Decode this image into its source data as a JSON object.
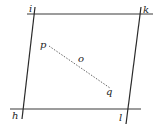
{
  "diagram": {
    "type": "geometric-figure",
    "background": "#ffffff",
    "stroke_color": "#2a2a2a",
    "lines": [
      {
        "name": "top-line",
        "from": [
          27,
          14
        ],
        "to": [
          153,
          14
        ],
        "style": "solid"
      },
      {
        "name": "bottom-line",
        "from": [
          10,
          109
        ],
        "to": [
          141,
          109
        ],
        "style": "solid"
      },
      {
        "name": "left-line",
        "from": [
          35,
          7
        ],
        "to": [
          22,
          119
        ],
        "style": "solid"
      },
      {
        "name": "right-line",
        "from": [
          141,
          7
        ],
        "to": [
          126,
          124
        ],
        "style": "solid"
      },
      {
        "name": "pq-segment",
        "from": [
          47,
          45
        ],
        "to": [
          112,
          89
        ],
        "style": "dotted"
      }
    ],
    "labels": {
      "i": "i",
      "k": "k",
      "h": "h",
      "l": "l",
      "p": "p",
      "o": "o",
      "q": "q"
    }
  }
}
